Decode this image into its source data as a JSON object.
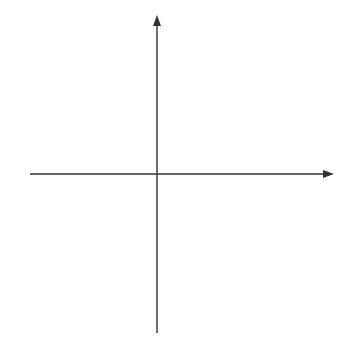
{
  "chart_data": {
    "type": "line",
    "title": "",
    "xlabel": "x",
    "ylabel": "y",
    "xlim": [
      -4,
      6
    ],
    "ylim": [
      -5,
      5
    ],
    "grid": true,
    "x_tick_labels": [
      "-4",
      "6"
    ],
    "y_tick_labels": [
      "5",
      "-5"
    ],
    "series": [
      {
        "name": "linear piece",
        "equation": "y = 2x - 1",
        "domain": [
          -2,
          1
        ],
        "start": {
          "x": -2,
          "y": -5,
          "marker": "closed"
        },
        "end": {
          "x": 1,
          "y": 1,
          "marker": "closed"
        },
        "points": [
          [
            -2,
            -5
          ],
          [
            1,
            1
          ]
        ]
      },
      {
        "name": "parabolic piece",
        "equation": "y = -(x - 3)^2 + 5",
        "domain": [
          1,
          5.9
        ],
        "start": {
          "x": 1,
          "y": 1,
          "marker": "open"
        },
        "end": {
          "x": 5.9,
          "y": -3.41,
          "marker": "arrow"
        },
        "vertex": {
          "x": 3,
          "y": 5
        },
        "x_intercept": 5.24,
        "points": [
          [
            1,
            1
          ],
          [
            1.5,
            2.75
          ],
          [
            2,
            4
          ],
          [
            2.5,
            4.75
          ],
          [
            3,
            5
          ],
          [
            3.5,
            4.75
          ],
          [
            4,
            4
          ],
          [
            4.5,
            2.75
          ],
          [
            5,
            1
          ],
          [
            5.24,
            0
          ],
          [
            5.5,
            -1.25
          ],
          [
            5.9,
            -3.41
          ]
        ]
      }
    ],
    "colors": {
      "curve": "#6e6e6e",
      "axis": "#333333",
      "grid": "#c8c8c8"
    }
  },
  "labels": {
    "x_axis": "x",
    "y_axis": "y",
    "x_min": "−4",
    "x_max": "6",
    "y_max": "5",
    "y_min": "−5"
  }
}
